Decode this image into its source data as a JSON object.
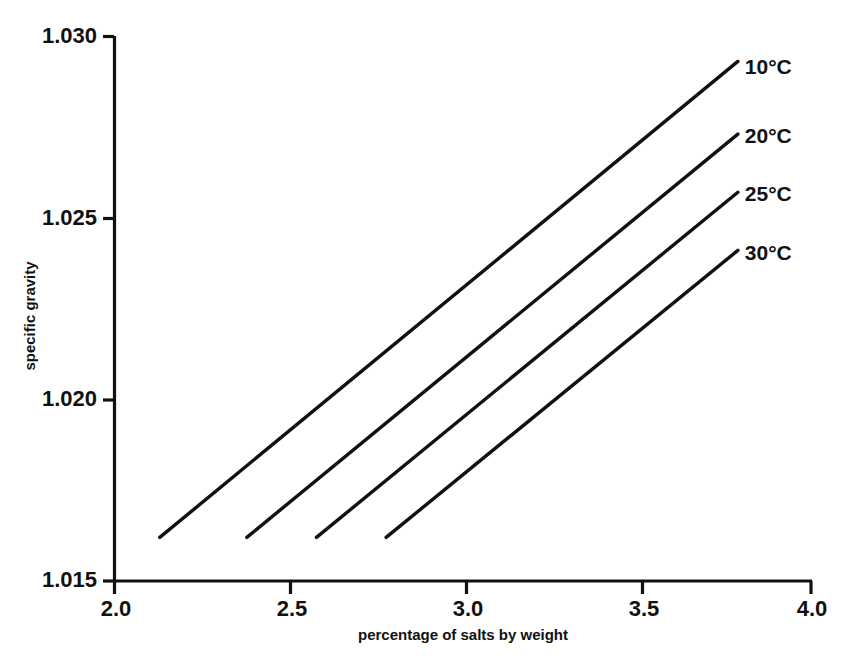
{
  "chart_data": {
    "type": "line",
    "title": "",
    "xlabel": "percentage of salts by weight",
    "ylabel": "specific gravity",
    "xlim": [
      2.0,
      4.0
    ],
    "ylim": [
      1.015,
      1.03
    ],
    "xticks": [
      "2.0",
      "2.5",
      "3.0",
      "3.5",
      "4.0"
    ],
    "xtick_values": [
      2.0,
      2.5,
      3.0,
      3.5,
      4.0
    ],
    "yticks": [
      "1.015",
      "1.020",
      "1.025",
      "1.030"
    ],
    "ytick_values": [
      1.015,
      1.02,
      1.025,
      1.03
    ],
    "grid": false,
    "legend_position": "right-of-line-ends",
    "series": [
      {
        "name": "10°C",
        "label": "10°C",
        "x": [
          2.13,
          3.79
        ],
        "y": [
          1.0162,
          1.0293
        ],
        "label_x": 3.81,
        "label_y": 1.0291
      },
      {
        "name": "20°C",
        "label": "20°C",
        "x": [
          2.38,
          3.79
        ],
        "y": [
          1.0162,
          1.0273
        ],
        "label_x": 3.81,
        "label_y": 1.0272
      },
      {
        "name": "25°C",
        "label": "25°C",
        "x": [
          2.58,
          3.79
        ],
        "y": [
          1.0162,
          1.0257
        ],
        "label_x": 3.81,
        "label_y": 1.0256
      },
      {
        "name": "30°C",
        "label": "30°C",
        "x": [
          2.78,
          3.79
        ],
        "y": [
          1.0162,
          1.0241
        ],
        "label_x": 3.81,
        "label_y": 1.024
      }
    ]
  },
  "axes": {
    "x_tick_labels": [
      "2.0",
      "2.5",
      "3.0",
      "3.5",
      "4.0"
    ],
    "y_tick_labels": [
      "1.030",
      "1.025",
      "1.020",
      "1.015"
    ],
    "x_axis_title": "percentage of salts by weight",
    "y_axis_title": "specific gravity"
  },
  "colors": {
    "ink": "#111111",
    "background": "#ffffff"
  }
}
